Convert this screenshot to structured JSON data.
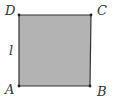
{
  "figure": {
    "shape": "square",
    "fill_color": "#b3b3b3",
    "stroke_color": "#333333",
    "vertices": [
      {
        "name": "A",
        "x": 19,
        "y": 86
      },
      {
        "name": "B",
        "x": 90,
        "y": 86
      },
      {
        "name": "C",
        "x": 91,
        "y": 15
      },
      {
        "name": "D",
        "x": 19,
        "y": 15
      }
    ],
    "labels": {
      "A": "A",
      "B": "B",
      "C": "C",
      "D": "D",
      "side": "l"
    }
  }
}
